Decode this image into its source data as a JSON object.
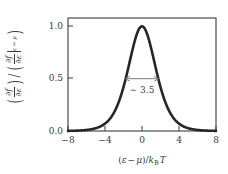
{
  "figure": {
    "name": "fermi-dirac-derivative-plot",
    "background_color": "#ffffff",
    "curve_color": "#262626",
    "axis_color": "#3b3b3b",
    "annotation_color": "#7d7d7d"
  },
  "axes": {
    "x": {
      "label_plain": "(ε − μ)/k_B T",
      "label_parts": {
        "open": "(",
        "epsilon": "ε",
        "minus": "−",
        "mu": "μ",
        "close": ")",
        "slash": "/",
        "k": "k",
        "k_sub": "B",
        "T": "T"
      },
      "ticks": [
        "−8",
        "−4",
        "0",
        "4",
        "8"
      ],
      "tick_values": [
        -8,
        -4,
        0,
        4,
        8
      ],
      "range": [
        -8,
        8
      ]
    },
    "y": {
      "label_plain": "(∂f/∂ε) / (∂f/∂ε |ε=μ)",
      "label_parts": {
        "num_partial_f": "∂f",
        "num_partial_eps": "∂ε",
        "den_partial_f": "∂f",
        "den_partial_eps": "∂ε",
        "eval_sub": "ε = μ",
        "slash": "/"
      },
      "ticks": [
        "0.0",
        "0.5",
        "1.0"
      ],
      "tick_values": [
        0.0,
        0.5,
        1.0
      ],
      "range": [
        0,
        1.08
      ]
    }
  },
  "annotations": [
    {
      "name": "fwhm-annotation",
      "text": "∼ 3.5",
      "arrow": "double-headed",
      "y_value": 0.5,
      "x_start": -1.76,
      "x_end": 1.76
    }
  ],
  "chart_data": {
    "type": "line",
    "title": "",
    "xlabel": "(ε − μ)/k_B T",
    "ylabel": "(∂f/∂ε) / (∂f/∂ε |ε=μ)",
    "xlim": [
      -8,
      8
    ],
    "ylim": [
      0,
      1.08
    ],
    "xticks": [
      -8,
      -4,
      0,
      4,
      8
    ],
    "yticks": [
      0.0,
      0.5,
      1.0
    ],
    "grid": false,
    "legend": null,
    "series": [
      {
        "name": "normalized sech^2(x/2)",
        "formula": "y = sech^2(x/2) = 1 / cosh^2(x/2)",
        "x": [
          -8.0,
          -7.5,
          -7.0,
          -6.5,
          -6.0,
          -5.5,
          -5.0,
          -4.5,
          -4.0,
          -3.5,
          -3.0,
          -2.5,
          -2.0,
          -1.75,
          -1.5,
          -1.25,
          -1.0,
          -0.75,
          -0.5,
          -0.25,
          0.0,
          0.25,
          0.5,
          0.75,
          1.0,
          1.25,
          1.5,
          1.75,
          2.0,
          2.5,
          3.0,
          3.5,
          4.0,
          4.5,
          5.0,
          5.5,
          6.0,
          6.5,
          7.0,
          7.5,
          8.0
        ],
        "y": [
          0.0013,
          0.0022,
          0.0036,
          0.006,
          0.0099,
          0.0162,
          0.0266,
          0.0435,
          0.0707,
          0.1142,
          0.1815,
          0.28,
          0.41,
          0.4814,
          0.5519,
          0.618,
          0.6766,
          0.7256,
          0.764,
          0.7911,
          1.0,
          0.7911,
          0.764,
          0.7256,
          0.6766,
          0.618,
          0.5519,
          0.4814,
          0.41,
          0.28,
          0.1815,
          0.1142,
          0.0707,
          0.0435,
          0.0266,
          0.0162,
          0.0099,
          0.006,
          0.0036,
          0.0022,
          0.0013
        ],
        "peak": {
          "x": 0.0,
          "y": 1.0
        },
        "fwhm": 3.5
      }
    ]
  }
}
